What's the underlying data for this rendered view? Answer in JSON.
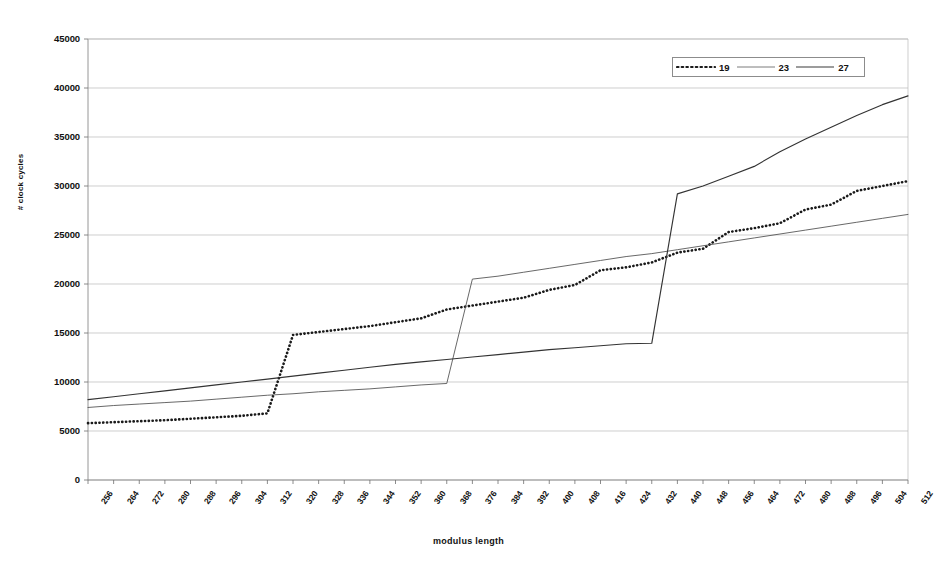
{
  "chart_data": {
    "type": "line",
    "title": "",
    "xlabel": "modulus length",
    "ylabel": "# clock cycles",
    "xlim": [
      256,
      512
    ],
    "ylim": [
      0,
      45000
    ],
    "ytick_step": 5000,
    "xtick_step": 8,
    "grid": true,
    "legend_position": "top-right",
    "yticks": [
      0,
      5000,
      10000,
      15000,
      20000,
      25000,
      30000,
      35000,
      40000,
      45000
    ],
    "categories": [
      256,
      264,
      272,
      280,
      288,
      296,
      304,
      312,
      320,
      328,
      336,
      344,
      352,
      360,
      368,
      376,
      384,
      392,
      400,
      408,
      416,
      424,
      432,
      440,
      448,
      456,
      464,
      472,
      480,
      488,
      496,
      504,
      512
    ],
    "series": [
      {
        "name": "19",
        "style": "dotted",
        "color": "#1a1a1a",
        "values": [
          5800,
          5900,
          6000,
          6100,
          6250,
          6400,
          6550,
          6800,
          14800,
          15100,
          15400,
          15700,
          16100,
          16500,
          17400,
          17800,
          18200,
          18600,
          19400,
          19900,
          21400,
          21700,
          22200,
          23200,
          23600,
          25300,
          25700,
          26200,
          27600,
          28100,
          29500,
          30000,
          30500
        ]
      },
      {
        "name": "23",
        "style": "thin-solid",
        "color": "#4d4d4d",
        "values": [
          7400,
          7600,
          7750,
          7900,
          8050,
          8250,
          8450,
          8650,
          8800,
          9000,
          9150,
          9300,
          9500,
          9700,
          9850,
          20500,
          20800,
          21200,
          21600,
          22000,
          22400,
          22800,
          23100,
          23500,
          23900,
          24300,
          24700,
          25100,
          25500,
          25900,
          26300,
          26700,
          27100
        ]
      },
      {
        "name": "27",
        "style": "solid",
        "color": "#333333",
        "values": [
          8200,
          8500,
          8800,
          9100,
          9400,
          9700,
          10000,
          10300,
          10600,
          10900,
          11200,
          11500,
          11800,
          12050,
          12300,
          12550,
          12800,
          13050,
          13300,
          13500,
          13700,
          13900,
          13950,
          29200,
          30000,
          31000,
          32000,
          33500,
          34800,
          36000,
          37200,
          38300,
          39200
        ]
      }
    ],
    "note_series_19_detail": "staircase, jump at 320 from 6800 to 14800",
    "note_series_23_detail": "near-linear, jump at 376 from 9850 to 20500",
    "note_series_27_detail": "near-linear, jump at 440 from 13950 to 29200"
  },
  "legend": {
    "items": [
      {
        "label": "19",
        "style": "dotted"
      },
      {
        "label": "23",
        "style": "thin-solid"
      },
      {
        "label": "27",
        "style": "solid"
      }
    ]
  },
  "axes": {
    "x_title": "modulus length",
    "y_title": "# clock cycles"
  }
}
